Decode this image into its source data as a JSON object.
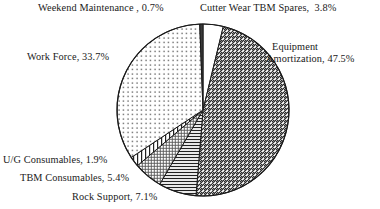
{
  "chart_data": {
    "type": "pie",
    "title": "",
    "xlabel": "",
    "ylabel": "",
    "legend_position": "none",
    "grid": false,
    "units": "percent",
    "total": 100.1,
    "categories": [
      "Cutter Wear TBM Spares",
      "Equipment Amortization",
      "Rock Support",
      "TBM Consumables",
      "U/G Consumables",
      "Work Force",
      "Weekend Maintenance"
    ],
    "values": [
      3.8,
      47.5,
      7.1,
      5.4,
      1.9,
      33.7,
      0.7
    ],
    "slices": [
      {
        "key": "cutter-wear-tbm-spares",
        "name": "Cutter Wear TBM Spares",
        "value": 3.8,
        "label": "Cutter Wear TBM Spares,  3.8%",
        "pattern": "solid-white",
        "start_deg": 0,
        "end_deg": 13.68
      },
      {
        "key": "equipment-amortization",
        "name": "Equipment Amortization",
        "value": 47.5,
        "label_line1": "Equipment",
        "label_line2": "Amortization, 47.5%",
        "pattern": "diagonal-hatch-up",
        "start_deg": 13.68,
        "end_deg": 184.68
      },
      {
        "key": "rock-support",
        "name": "Rock Support",
        "value": 7.1,
        "label": "Rock Support, 7.1%",
        "pattern": "horizontal-lines",
        "start_deg": 184.68,
        "end_deg": 210.24
      },
      {
        "key": "tbm-consumables",
        "name": "TBM Consumables",
        "value": 5.4,
        "label": "TBM Consumables, 5.4%",
        "pattern": "cross-hatch-fine",
        "start_deg": 210.24,
        "end_deg": 229.68
      },
      {
        "key": "ug-consumables",
        "name": "U/G Consumables",
        "value": 1.9,
        "label": "U/G Consumables, 1.9%",
        "pattern": "vertical-lines",
        "start_deg": 229.68,
        "end_deg": 236.52
      },
      {
        "key": "work-force",
        "name": "Work Force",
        "value": 33.7,
        "label": "Work Force, 33.7%",
        "pattern": "sparse-dots",
        "start_deg": 236.52,
        "end_deg": 357.84
      },
      {
        "key": "weekend-maintenance",
        "name": "Weekend Maintenance",
        "value": 0.7,
        "label": "Weekend Maintenance , 0.7%",
        "pattern": "solid-dark",
        "start_deg": 357.84,
        "end_deg": 360
      }
    ],
    "geometry": {
      "center_x": 203,
      "center_y": 110,
      "radius": 86
    },
    "colors": {
      "outline": "#1a1a1a",
      "text": "#1a1a1a",
      "background": "#ffffff",
      "pattern_ink": "#222222",
      "solid_dark": "#3a3a3a"
    }
  }
}
